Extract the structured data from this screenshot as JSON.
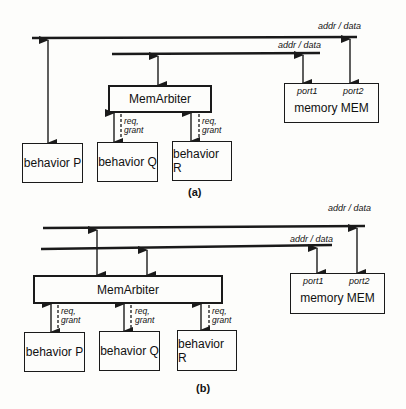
{
  "diagram_a": {
    "caption": "(a)",
    "bus_top_label": "addr / data",
    "bus_second_label": "addr / data",
    "arbiter": "MemArbiter",
    "memory": {
      "name": "memory MEM",
      "port1": "port1",
      "port2": "port2"
    },
    "behaviors": [
      "behavior P",
      "behavior Q",
      "behavior R"
    ],
    "signals": [
      {
        "line1": "req,",
        "line2": "grant"
      },
      {
        "line1": "req,",
        "line2": "grant"
      }
    ]
  },
  "diagram_b": {
    "caption": "(b)",
    "bus_top_label": "addr / data",
    "bus_second_label": "addr / data",
    "arbiter": "MemArbiter",
    "memory": {
      "name": "memory MEM",
      "port1": "port1",
      "port2": "port2"
    },
    "behaviors": [
      "behavior P",
      "behavior Q",
      "behavior R"
    ],
    "signals": [
      {
        "line1": "req,",
        "line2": "grant"
      },
      {
        "line1": "req,",
        "line2": "grant"
      },
      {
        "line1": "req,",
        "line2": "grant"
      }
    ]
  },
  "colors": {
    "line": "#1a1a1a",
    "background": "#fdfdfb"
  }
}
